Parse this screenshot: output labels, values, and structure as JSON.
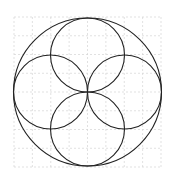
{
  "diagram": {
    "title": "",
    "background": "#ffffff",
    "grid": {
      "x0": 14,
      "y0": 17,
      "x1": 161,
      "y1": 167,
      "cols": 8,
      "rows": 8,
      "color": "#d4d4d4",
      "dash": "2,2"
    },
    "stroke": "#222222",
    "outer_circle": {
      "cx": 87.5,
      "cy": 92,
      "r": 74
    },
    "inner_circles": [
      {
        "name": "top",
        "cx": 87.5,
        "cy": 55,
        "r": 37
      },
      {
        "name": "bottom",
        "cx": 87.5,
        "cy": 129,
        "r": 37
      },
      {
        "name": "left",
        "cx": 50.5,
        "cy": 92,
        "r": 37
      },
      {
        "name": "right",
        "cx": 124.5,
        "cy": 92,
        "r": 37
      }
    ]
  }
}
